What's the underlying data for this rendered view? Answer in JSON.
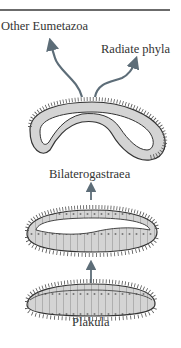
{
  "diagram": {
    "labels": {
      "other_eumetazoa": "Other Eumetazoa",
      "radiate_phyla": "Radiate phyla",
      "bilaterogastraea": "Bilaterogastraea",
      "plakula": "Plakula"
    },
    "stages": [
      "Plakula",
      "Intermediate folded plakula",
      "Bilaterogastraea"
    ],
    "branches": [
      "Other Eumetazoa",
      "Radiate phyla"
    ],
    "colors": {
      "arrow": "#5d6d78",
      "cell_fill": "#d4d4d4",
      "outline": "#333333",
      "rule": "#6b6b6b"
    }
  }
}
